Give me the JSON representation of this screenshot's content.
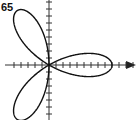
{
  "figure": {
    "exercise_number": "65"
  },
  "chart_data": {
    "type": "line",
    "subtype": "polar",
    "title": "",
    "label": "65",
    "equation_form": "r = a cos(3θ)",
    "petals": 3,
    "petal_directions_deg": [
      0,
      120,
      240
    ],
    "r_max_units": 9,
    "xlabel": "",
    "ylabel": "",
    "xlim": [
      -5,
      12
    ],
    "ylim": [
      -8,
      9
    ],
    "grid": false,
    "axis_ticks": true,
    "x_axis_arrow": true,
    "colors": {
      "curve": "#111111",
      "axes": "#333333"
    }
  }
}
